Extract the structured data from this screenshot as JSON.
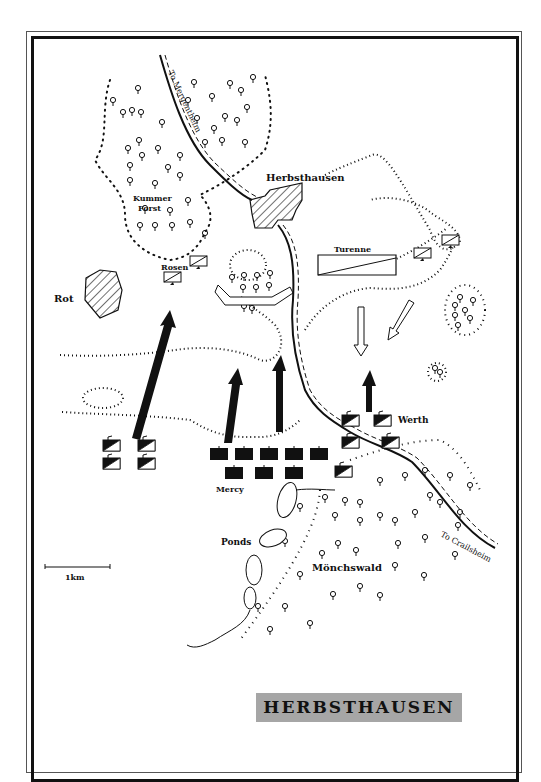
{
  "map": {
    "title": "HERBSTHAUSEN",
    "places": {
      "herbsthausen": "Herbsthausen",
      "kummer_forst_1": "Kummer",
      "kummer_forst_2": "Forst",
      "rot": "Rot",
      "ponds": "Ponds",
      "monchswald": "Mönchswald"
    },
    "roads": {
      "north": "To Mergentheim",
      "southeast": "To Crailsheim"
    },
    "commanders": {
      "turenne": "Turenne",
      "rosen": "Rosen",
      "mercy": "Mercy",
      "werth": "Werth"
    },
    "scale": {
      "label": "1km"
    },
    "colors": {
      "ink": "#111111",
      "title_bg": "#a6a6a6",
      "paper": "#ffffff"
    }
  }
}
